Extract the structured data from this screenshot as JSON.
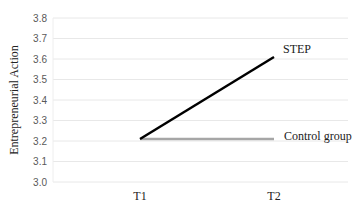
{
  "chart_data": {
    "type": "line",
    "title": "",
    "xlabel": "",
    "ylabel": "Entrepreneurial Action",
    "categories": [
      "T1",
      "T2"
    ],
    "series": [
      {
        "name": "STEP",
        "values": [
          3.21,
          3.61
        ],
        "color": "#000000"
      },
      {
        "name": "Control group",
        "values": [
          3.21,
          3.21
        ],
        "color": "#a6a6a6"
      }
    ],
    "ylim": [
      3.0,
      3.8
    ],
    "yticks": [
      "3.0",
      "3.1",
      "3.2",
      "3.3",
      "3.4",
      "3.5",
      "3.6",
      "3.7",
      "3.8"
    ],
    "grid": true,
    "legend": "inline labels at line ends"
  }
}
